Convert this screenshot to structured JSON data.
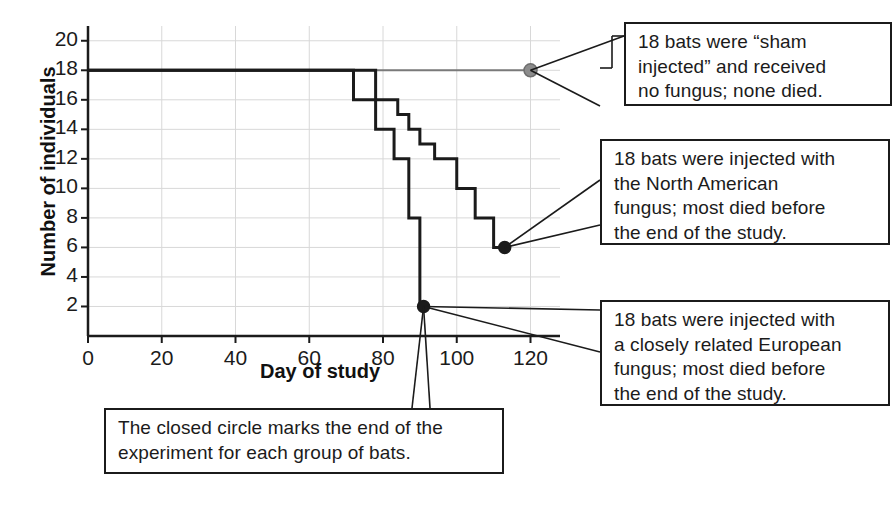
{
  "chart_data": {
    "type": "line",
    "title": "",
    "subtitle": "",
    "xlabel": "Day of study",
    "ylabel": "Number of individuals",
    "xlim": [
      0,
      128
    ],
    "ylim": [
      0,
      21
    ],
    "xticks": [
      0,
      20,
      40,
      60,
      80,
      100,
      120
    ],
    "yticks": [
      2,
      4,
      6,
      8,
      10,
      12,
      14,
      16,
      18,
      20
    ],
    "grid": true,
    "legend_position": "none",
    "step_style": "post",
    "series": [
      {
        "name": "sham-injected",
        "color": "#7a7a7a",
        "linewidth": 2,
        "endpoint_marker": "open-gray-circle",
        "points": [
          {
            "x": 0,
            "y": 18
          },
          {
            "x": 120,
            "y": 18
          }
        ],
        "endpoint": {
          "x": 120,
          "y": 18
        }
      },
      {
        "name": "european-fungus",
        "color": "#1b1b1b",
        "linewidth": 3,
        "endpoint_marker": "closed-black-circle",
        "points": [
          {
            "x": 0,
            "y": 18
          },
          {
            "x": 72,
            "y": 18
          },
          {
            "x": 72,
            "y": 16
          },
          {
            "x": 78,
            "y": 16
          },
          {
            "x": 78,
            "y": 14
          },
          {
            "x": 83,
            "y": 14
          },
          {
            "x": 83,
            "y": 12
          },
          {
            "x": 87,
            "y": 12
          },
          {
            "x": 87,
            "y": 8
          },
          {
            "x": 90,
            "y": 8
          },
          {
            "x": 90,
            "y": 2
          },
          {
            "x": 91,
            "y": 2
          }
        ],
        "endpoint": {
          "x": 91,
          "y": 2
        }
      },
      {
        "name": "north-american-fungus",
        "color": "#1b1b1b",
        "linewidth": 3,
        "endpoint_marker": "closed-black-circle",
        "points": [
          {
            "x": 0,
            "y": 18
          },
          {
            "x": 78,
            "y": 18
          },
          {
            "x": 78,
            "y": 16
          },
          {
            "x": 84,
            "y": 16
          },
          {
            "x": 84,
            "y": 15
          },
          {
            "x": 87,
            "y": 15
          },
          {
            "x": 87,
            "y": 14
          },
          {
            "x": 90,
            "y": 14
          },
          {
            "x": 90,
            "y": 13
          },
          {
            "x": 94,
            "y": 13
          },
          {
            "x": 94,
            "y": 12
          },
          {
            "x": 100,
            "y": 12
          },
          {
            "x": 100,
            "y": 10
          },
          {
            "x": 105,
            "y": 10
          },
          {
            "x": 105,
            "y": 8
          },
          {
            "x": 110,
            "y": 8
          },
          {
            "x": 110,
            "y": 6
          },
          {
            "x": 113,
            "y": 6
          }
        ],
        "endpoint": {
          "x": 113,
          "y": 6
        }
      }
    ],
    "annotations": [
      {
        "id": "sham",
        "text": "18 bats were “sham\ninjected” and received\nno fungus; none died.",
        "anchor": {
          "x": 120,
          "y": 18
        }
      },
      {
        "id": "north-american",
        "text": "18 bats were injected with\nthe North American\nfungus; most died before\nthe end of the study.",
        "anchor": {
          "x": 113,
          "y": 6
        }
      },
      {
        "id": "european",
        "text": "18 bats were injected with\na closely related European\nfungus; most died before\nthe end of the study.",
        "anchor": {
          "x": 91,
          "y": 2
        }
      },
      {
        "id": "closed-circle",
        "text": "The closed circle marks the end of the\nexperiment for each group of bats.",
        "anchor": {
          "x": 91,
          "y": 2
        }
      }
    ]
  },
  "axes": {
    "xlabel": "Day of study",
    "ylabel": "Number of individuals",
    "xtick_labels": [
      "0",
      "20",
      "40",
      "60",
      "80",
      "100",
      "120"
    ],
    "ytick_labels": [
      "20",
      "18",
      "16",
      "14",
      "12",
      "10",
      "8",
      "6",
      "4",
      "2"
    ]
  },
  "colors": {
    "axis": "#1b1b1b",
    "grid": "#d8d8d8",
    "sham_line": "#7a7a7a",
    "fungus_line": "#1b1b1b",
    "box_border": "#1b1b1b",
    "text": "#1b1b1b",
    "background": "#ffffff"
  }
}
